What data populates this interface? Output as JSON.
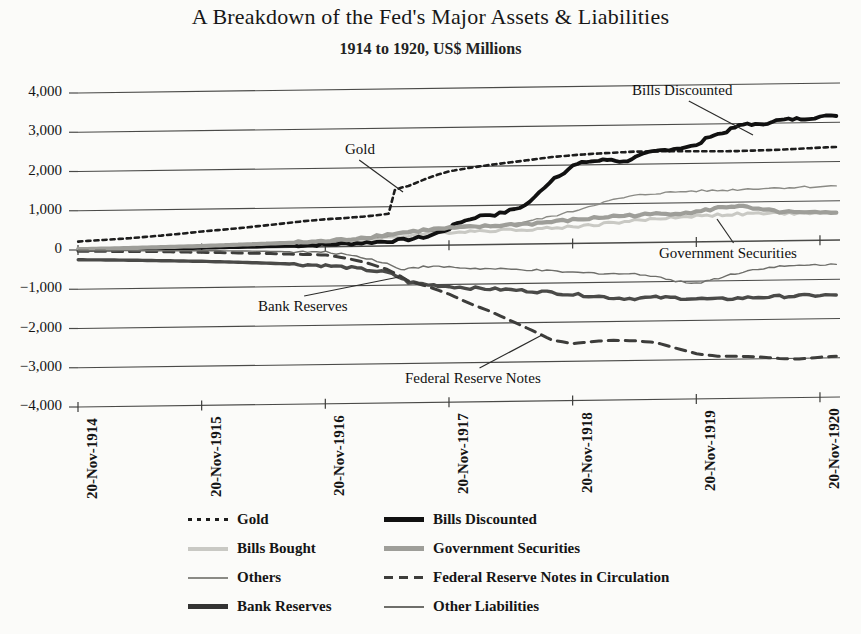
{
  "header": {
    "title": "A Breakdown of the Fed's Major Assets & Liabilities",
    "subtitle": "1914 to 1920, US$ Millions"
  },
  "chart_data": {
    "type": "line",
    "title": "A Breakdown of the Fed's Major Assets & Liabilities",
    "subtitle": "1914 to 1920, US$ Millions",
    "xlabel": "",
    "ylabel": "US$ Millions",
    "ylim": [
      -4000,
      4000
    ],
    "ytick_step": 1000,
    "yticks": [
      "4,000",
      "3,000",
      "2,000",
      "1,000",
      "0",
      "−1,000",
      "−2,000",
      "−3,000",
      "−4,000"
    ],
    "ytick_values": [
      4000,
      3000,
      2000,
      1000,
      0,
      -1000,
      -2000,
      -3000,
      -4000
    ],
    "xticks": [
      "20-Nov-1914",
      "20-Nov-1915",
      "20-Nov-1916",
      "20-Nov-1917",
      "20-Nov-1918",
      "20-Nov-1919",
      "20-Nov-1920"
    ],
    "xtick_values": [
      1914.888,
      1915.888,
      1916.888,
      1917.888,
      1918.888,
      1919.888,
      1920.888
    ],
    "xlim": [
      1914.888,
      1921.05
    ],
    "grid": true,
    "grid_axis": "y",
    "legend_position": "bottom",
    "series": [
      {
        "name": "Gold",
        "style": "dotted",
        "color": "#1d1d1d",
        "width": 2.6,
        "x": [
          1914.89,
          1915.05,
          1915.22,
          1915.39,
          1915.56,
          1915.72,
          1915.89,
          1916.06,
          1916.22,
          1916.39,
          1916.56,
          1916.72,
          1916.89,
          1917.02,
          1917.12,
          1917.22,
          1917.32,
          1917.4,
          1917.45,
          1917.5,
          1917.56,
          1917.64,
          1917.72,
          1917.8,
          1917.89,
          1918.05,
          1918.22,
          1918.39,
          1918.56,
          1918.72,
          1918.89,
          1919.06,
          1919.22,
          1919.39,
          1919.56,
          1919.72,
          1919.89,
          1920.06,
          1920.22,
          1920.39,
          1920.56,
          1920.72,
          1920.89,
          1921.02
        ],
        "values": [
          215,
          240,
          268,
          300,
          340,
          380,
          430,
          470,
          510,
          560,
          610,
          660,
          700,
          720,
          740,
          760,
          790,
          820,
          1420,
          1480,
          1520,
          1620,
          1720,
          1800,
          1880,
          1960,
          2030,
          2090,
          2150,
          2210,
          2250,
          2280,
          2300,
          2320,
          2320,
          2320,
          2310,
          2300,
          2300,
          2310,
          2320,
          2340,
          2360,
          2370
        ]
      },
      {
        "name": "Bills Bought",
        "style": "solid",
        "color": "#c9c9c4",
        "width": 3.0,
        "x": [
          1914.89,
          1915.22,
          1915.56,
          1915.89,
          1916.22,
          1916.56,
          1916.89,
          1917.06,
          1917.22,
          1917.39,
          1917.56,
          1917.72,
          1917.89,
          1918.06,
          1918.22,
          1918.39,
          1918.56,
          1918.72,
          1918.89,
          1919.06,
          1919.22,
          1919.39,
          1919.56,
          1919.72,
          1919.89,
          1920.06,
          1920.22,
          1920.39,
          1920.56,
          1920.72,
          1920.89,
          1921.02
        ],
        "values": [
          8,
          15,
          25,
          35,
          60,
          90,
          120,
          140,
          165,
          210,
          260,
          300,
          330,
          350,
          360,
          370,
          380,
          400,
          430,
          470,
          520,
          560,
          600,
          640,
          660,
          680,
          690,
          700,
          700,
          700,
          700,
          700
        ]
      },
      {
        "name": "Others",
        "style": "solid",
        "color": "#8a8a85",
        "width": 1.4,
        "x": [
          1914.89,
          1915.22,
          1915.56,
          1915.89,
          1916.22,
          1916.56,
          1916.89,
          1917.06,
          1917.22,
          1917.39,
          1917.56,
          1917.72,
          1917.89,
          1918.06,
          1918.22,
          1918.39,
          1918.56,
          1918.72,
          1918.89,
          1919.06,
          1919.22,
          1919.39,
          1919.56,
          1919.72,
          1919.89,
          1920.06,
          1920.22,
          1920.39,
          1920.56,
          1920.72,
          1920.89,
          1921.02
        ],
        "values": [
          10,
          18,
          30,
          48,
          70,
          95,
          120,
          160,
          200,
          250,
          310,
          360,
          400,
          430,
          470,
          520,
          600,
          700,
          820,
          980,
          1100,
          1200,
          1250,
          1280,
          1300,
          1300,
          1320,
          1340,
          1350,
          1360,
          1370,
          1380
        ]
      },
      {
        "name": "Bank Reserves",
        "style": "solid",
        "color": "#4a4a48",
        "width": 3.4,
        "x": [
          1914.89,
          1915.22,
          1915.56,
          1915.89,
          1916.22,
          1916.56,
          1916.89,
          1917.06,
          1917.22,
          1917.39,
          1917.5,
          1917.56,
          1917.72,
          1917.89,
          1918.06,
          1918.22,
          1918.39,
          1918.56,
          1918.72,
          1918.89,
          1919.06,
          1919.22,
          1919.39,
          1919.56,
          1919.72,
          1919.89,
          1920.06,
          1920.22,
          1920.39,
          1920.56,
          1920.72,
          1920.89,
          1921.02
        ],
        "values": [
          -250,
          -270,
          -300,
          -330,
          -370,
          -420,
          -480,
          -530,
          -600,
          -680,
          -820,
          -930,
          -1000,
          -1050,
          -1100,
          -1130,
          -1160,
          -1200,
          -1240,
          -1300,
          -1340,
          -1400,
          -1420,
          -1400,
          -1420,
          -1450,
          -1470,
          -1450,
          -1430,
          -1420,
          -1410,
          -1400,
          -1400
        ]
      },
      {
        "name": "Bills Discounted",
        "style": "solid",
        "color": "#111111",
        "width": 3.8,
        "x": [
          1914.89,
          1915.22,
          1915.56,
          1915.89,
          1916.22,
          1916.56,
          1916.89,
          1917.06,
          1917.22,
          1917.39,
          1917.56,
          1917.72,
          1917.89,
          1917.95,
          1918.02,
          1918.1,
          1918.18,
          1918.26,
          1918.34,
          1918.42,
          1918.5,
          1918.58,
          1918.66,
          1918.74,
          1918.82,
          1918.89,
          1919.0,
          1919.1,
          1919.2,
          1919.3,
          1919.4,
          1919.5,
          1919.6,
          1919.7,
          1919.8,
          1919.89,
          1920.0,
          1920.1,
          1920.2,
          1920.3,
          1920.4,
          1920.5,
          1920.6,
          1920.7,
          1920.8,
          1920.89,
          1921.02
        ],
        "values": [
          0,
          4,
          8,
          14,
          25,
          40,
          55,
          70,
          90,
          120,
          160,
          230,
          420,
          560,
          620,
          700,
          760,
          760,
          820,
          900,
          980,
          1180,
          1450,
          1680,
          1820,
          1980,
          2080,
          2100,
          2130,
          2060,
          2180,
          2280,
          2340,
          2380,
          2420,
          2450,
          2700,
          2760,
          2900,
          3000,
          2950,
          3050,
          3080,
          3100,
          3120,
          3150,
          3160
        ]
      },
      {
        "name": "Government Securities",
        "style": "solid",
        "color": "#9e9e99",
        "width": 4.2,
        "x": [
          1914.89,
          1915.22,
          1915.56,
          1915.89,
          1916.22,
          1916.56,
          1916.89,
          1917.06,
          1917.22,
          1917.39,
          1917.56,
          1917.72,
          1917.89,
          1918.06,
          1918.22,
          1918.39,
          1918.56,
          1918.72,
          1918.89,
          1919.06,
          1919.22,
          1919.39,
          1919.56,
          1919.72,
          1919.89,
          1920.0,
          1920.1,
          1920.2,
          1920.3,
          1920.39,
          1920.56,
          1920.72,
          1920.89,
          1921.02
        ],
        "values": [
          20,
          30,
          45,
          60,
          85,
          110,
          140,
          180,
          230,
          290,
          350,
          400,
          430,
          450,
          470,
          500,
          520,
          560,
          600,
          640,
          680,
          700,
          720,
          740,
          760,
          820,
          880,
          900,
          860,
          800,
          740,
          700,
          690,
          700
        ]
      },
      {
        "name": "Federal Reserve Notes in Circulation",
        "style": "dashed",
        "color": "#3d3d3b",
        "width": 3.0,
        "x": [
          1914.89,
          1915.22,
          1915.56,
          1915.89,
          1916.22,
          1916.56,
          1916.89,
          1917.06,
          1917.22,
          1917.39,
          1917.5,
          1917.56,
          1917.72,
          1917.89,
          1918.06,
          1918.22,
          1918.39,
          1918.56,
          1918.72,
          1918.89,
          1919.06,
          1919.22,
          1919.39,
          1919.56,
          1919.72,
          1919.89,
          1920.06,
          1920.22,
          1920.39,
          1920.56,
          1920.72,
          1920.89,
          1921.02
        ],
        "values": [
          -30,
          -50,
          -70,
          -100,
          -130,
          -170,
          -210,
          -300,
          -420,
          -600,
          -780,
          -900,
          -1050,
          -1250,
          -1500,
          -1700,
          -1950,
          -2200,
          -2450,
          -2550,
          -2500,
          -2480,
          -2500,
          -2550,
          -2700,
          -2850,
          -2920,
          -2930,
          -2950,
          -3000,
          -3020,
          -2980,
          -2960
        ]
      },
      {
        "name": "Other Liabilities",
        "style": "solid",
        "color": "#6e6e6a",
        "width": 1.4,
        "x": [
          1914.89,
          1915.22,
          1915.56,
          1915.89,
          1916.22,
          1916.56,
          1916.89,
          1917.06,
          1917.22,
          1917.39,
          1917.5,
          1917.56,
          1917.72,
          1917.89,
          1918.06,
          1918.22,
          1918.39,
          1918.56,
          1918.72,
          1918.89,
          1919.06,
          1919.22,
          1919.39,
          1919.56,
          1919.72,
          1919.89,
          1920.0,
          1920.1,
          1920.2,
          1920.3,
          1920.39,
          1920.56,
          1920.72,
          1920.89,
          1921.02
        ],
        "values": [
          -20,
          -30,
          -45,
          -60,
          -80,
          -110,
          -140,
          -200,
          -300,
          -450,
          -620,
          -560,
          -540,
          -560,
          -600,
          -620,
          -640,
          -660,
          -700,
          -740,
          -760,
          -780,
          -800,
          -850,
          -1000,
          -1050,
          -980,
          -900,
          -820,
          -760,
          -700,
          -660,
          -640,
          -620,
          -620
        ]
      }
    ],
    "annotations": [
      {
        "text": "Gold",
        "label_x": 345,
        "label_y": 141,
        "tip_x": 403,
        "tip_y": 192
      },
      {
        "text": "Bills Discounted",
        "label_x": 632,
        "label_y": 82,
        "tip_x": 753,
        "tip_y": 135
      },
      {
        "text": "Government Securities",
        "label_x": 659,
        "label_y": 245,
        "tip_x": 717,
        "tip_y": 219
      },
      {
        "text": "Bank Reserves",
        "label_x": 258,
        "label_y": 298,
        "tip_x": 399,
        "tip_y": 277
      },
      {
        "text": "Federal Reserve Notes",
        "label_x": 405,
        "label_y": 370,
        "tip_x": 542,
        "tip_y": 335
      }
    ]
  },
  "legend": {
    "items": [
      {
        "label": "Gold",
        "style": "dotted",
        "color": "#1d1d1d",
        "width": 3,
        "col": 0,
        "row": 0
      },
      {
        "label": "Bills Bought",
        "style": "solid",
        "color": "#c9c9c4",
        "width": 4,
        "col": 0,
        "row": 1
      },
      {
        "label": "Others",
        "style": "solid",
        "color": "#8a8a85",
        "width": 2,
        "col": 0,
        "row": 2
      },
      {
        "label": "Bank Reserves",
        "style": "solid",
        "color": "#333333",
        "width": 5,
        "col": 0,
        "row": 3
      },
      {
        "label": "Bills Discounted",
        "style": "solid",
        "color": "#111111",
        "width": 5,
        "col": 1,
        "row": 0
      },
      {
        "label": "Government Securities",
        "style": "solid",
        "color": "#9e9e99",
        "width": 5,
        "col": 1,
        "row": 1
      },
      {
        "label": "Federal Reserve Notes in Circulation",
        "style": "dashed",
        "color": "#3d3d3b",
        "width": 3,
        "col": 1,
        "row": 2
      },
      {
        "label": "Other Liabilities",
        "style": "solid",
        "color": "#6e6e6a",
        "width": 2,
        "col": 1,
        "row": 3
      }
    ]
  }
}
